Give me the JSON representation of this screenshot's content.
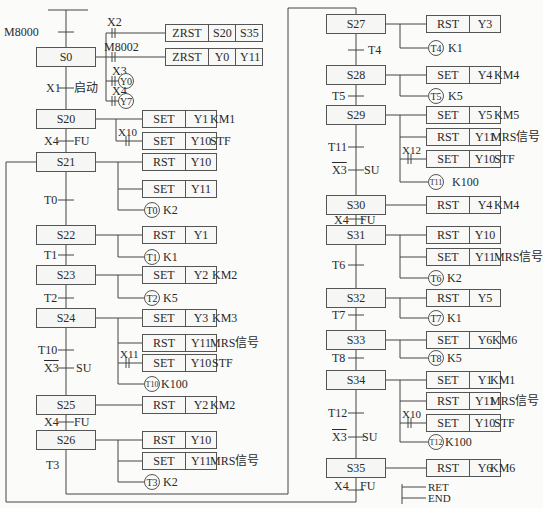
{
  "init": {
    "contact": "M8000",
    "step": "S0"
  },
  "s0_actions": [
    {
      "contact": "X2",
      "op": "ZRST",
      "a": "S20",
      "b": "S35"
    },
    {
      "contact": "M8002",
      "op": "ZRST",
      "a": "Y0",
      "b": "Y11"
    },
    {
      "contact": "X3",
      "coil": "Y0"
    },
    {
      "contact": "X4",
      "coil": "Y7"
    }
  ],
  "transitions": {
    "x1": "X1",
    "x1_note": "启动",
    "x4": "X4",
    "fu": "FU",
    "t0": "T0",
    "t1": "T1",
    "t2": "T2",
    "t10": "T10",
    "x3": "X3",
    "su": "SU",
    "t3": "T3",
    "t4": "T4",
    "t5": "T5",
    "t11": "T11",
    "t6": "T6",
    "t7": "T7",
    "t8": "T8",
    "t12": "T12"
  },
  "steps": {
    "s20": "S20",
    "s21": "S21",
    "s22": "S22",
    "s23": "S23",
    "s24": "S24",
    "s25": "S25",
    "s26": "S26",
    "s27": "S27",
    "s28": "S28",
    "s29": "S29",
    "s30": "S30",
    "s31": "S31",
    "s32": "S32",
    "s33": "S33",
    "s34": "S34",
    "s35": "S35"
  },
  "ops": {
    "set": "SET",
    "rst": "RST"
  },
  "devices": {
    "y1": "Y1",
    "y2": "Y2",
    "y3": "Y3",
    "y4": "Y4",
    "y5": "Y5",
    "y6": "Y6",
    "y10": "Y10",
    "y11": "Y11"
  },
  "notes": {
    "km1": "KM1",
    "km2": "KM2",
    "km3": "KM3",
    "km4": "KM4",
    "km5": "KM5",
    "km6": "KM6",
    "stf": "STF",
    "mrs": "MRS信号"
  },
  "contacts": {
    "x10": "X10",
    "x11": "X11",
    "x12": "X12"
  },
  "timers": {
    "t0": {
      "name": "T0",
      "k": "K2"
    },
    "t1": {
      "name": "T1",
      "k": "K1"
    },
    "t2": {
      "name": "T2",
      "k": "K5"
    },
    "t10": {
      "name": "T10",
      "k": "K100"
    },
    "t3": {
      "name": "T3",
      "k": "K2"
    },
    "t4": {
      "name": "T4",
      "k": "K1"
    },
    "t5": {
      "name": "T5",
      "k": "K5"
    },
    "t11": {
      "name": "T11",
      "k": "K100"
    },
    "t6": {
      "name": "T6",
      "k": "K2"
    },
    "t7": {
      "name": "T7",
      "k": "K1"
    },
    "t8": {
      "name": "T8",
      "k": "K5"
    },
    "t12": {
      "name": "T12",
      "k": "K100"
    }
  },
  "end": {
    "ret": "RET",
    "end": "END"
  }
}
